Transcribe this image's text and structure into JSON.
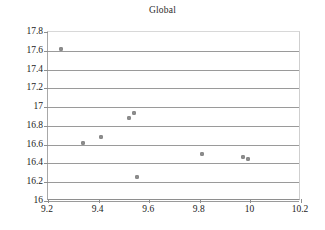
{
  "chart_data": {
    "type": "scatter",
    "title": "Global",
    "xlabel": "",
    "ylabel": "",
    "xlim": [
      9.2,
      10.2
    ],
    "ylim": [
      16,
      17.8
    ],
    "xticks": [
      "9.2",
      "9.4",
      "9.6",
      "9.8",
      "10",
      "10.2"
    ],
    "xtick_values": [
      9.2,
      9.4,
      9.6,
      9.8,
      10.0,
      10.2
    ],
    "yticks": [
      "16",
      "16.2",
      "16.4",
      "16.6",
      "16.8",
      "17",
      "17.2",
      "17.4",
      "17.6",
      "17.8"
    ],
    "ytick_values": [
      16,
      16.2,
      16.4,
      16.6,
      16.8,
      17,
      17.2,
      17.4,
      17.6,
      17.8
    ],
    "grid": "horizontal",
    "legend": "none",
    "marker_color": "#8c8c8c",
    "gridline_color": "#9a9a9a",
    "series": [
      {
        "name": "Global",
        "points": [
          {
            "x": 9.25,
            "y": 17.62
          },
          {
            "x": 9.34,
            "y": 16.62
          },
          {
            "x": 9.41,
            "y": 16.68
          },
          {
            "x": 9.52,
            "y": 16.88
          },
          {
            "x": 9.54,
            "y": 16.94
          },
          {
            "x": 9.55,
            "y": 16.26
          },
          {
            "x": 9.81,
            "y": 16.5
          },
          {
            "x": 9.97,
            "y": 16.47
          },
          {
            "x": 9.99,
            "y": 16.45
          }
        ]
      }
    ]
  }
}
